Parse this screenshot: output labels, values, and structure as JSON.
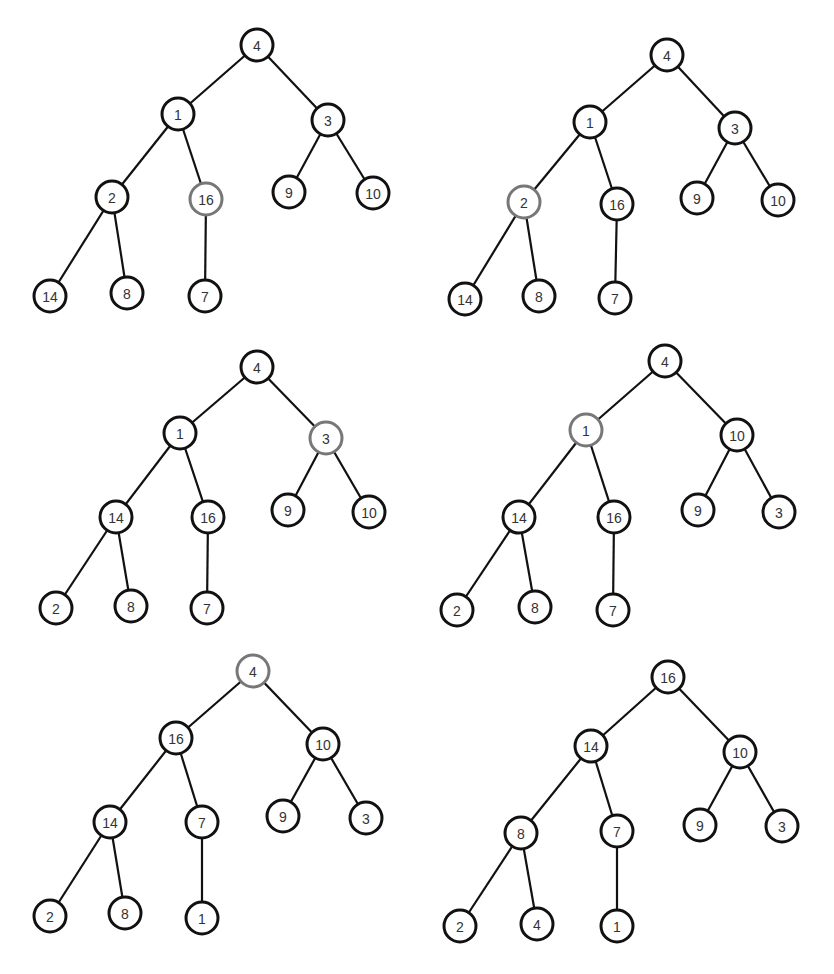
{
  "diagram": {
    "node_radius": 16,
    "colors": {
      "node_border": "#111111",
      "highlight_border": "#777777",
      "edge": "#111111",
      "text": "#333333",
      "background": "#ffffff"
    },
    "trees": [
      {
        "id": "step-a",
        "highlight": "16",
        "nodes": [
          {
            "id": "n0",
            "label": "4",
            "x": 257,
            "y": 45
          },
          {
            "id": "n1",
            "label": "1",
            "x": 178,
            "y": 114
          },
          {
            "id": "n2",
            "label": "3",
            "x": 328,
            "y": 120
          },
          {
            "id": "n3",
            "label": "2",
            "x": 112,
            "y": 197
          },
          {
            "id": "n4",
            "label": "16",
            "x": 206,
            "y": 199,
            "highlight": true
          },
          {
            "id": "n5",
            "label": "9",
            "x": 289,
            "y": 192
          },
          {
            "id": "n6",
            "label": "10",
            "x": 373,
            "y": 193
          },
          {
            "id": "n7",
            "label": "14",
            "x": 50,
            "y": 296
          },
          {
            "id": "n8",
            "label": "8",
            "x": 127,
            "y": 293
          },
          {
            "id": "n9",
            "label": "7",
            "x": 205,
            "y": 296
          }
        ],
        "edges": [
          [
            "n0",
            "n1"
          ],
          [
            "n0",
            "n2"
          ],
          [
            "n1",
            "n3"
          ],
          [
            "n1",
            "n4"
          ],
          [
            "n2",
            "n5"
          ],
          [
            "n2",
            "n6"
          ],
          [
            "n3",
            "n7"
          ],
          [
            "n3",
            "n8"
          ],
          [
            "n4",
            "n9"
          ]
        ]
      },
      {
        "id": "step-b",
        "highlight": "2",
        "nodes": [
          {
            "id": "n0",
            "label": "4",
            "x": 667,
            "y": 55
          },
          {
            "id": "n1",
            "label": "1",
            "x": 590,
            "y": 122
          },
          {
            "id": "n2",
            "label": "3",
            "x": 735,
            "y": 128
          },
          {
            "id": "n3",
            "label": "2",
            "x": 524,
            "y": 202,
            "highlight": true
          },
          {
            "id": "n4",
            "label": "16",
            "x": 617,
            "y": 204
          },
          {
            "id": "n5",
            "label": "9",
            "x": 697,
            "y": 198
          },
          {
            "id": "n6",
            "label": "10",
            "x": 778,
            "y": 200
          },
          {
            "id": "n7",
            "label": "14",
            "x": 465,
            "y": 299
          },
          {
            "id": "n8",
            "label": "8",
            "x": 539,
            "y": 296
          },
          {
            "id": "n9",
            "label": "7",
            "x": 615,
            "y": 298
          }
        ],
        "edges": [
          [
            "n0",
            "n1"
          ],
          [
            "n0",
            "n2"
          ],
          [
            "n1",
            "n3"
          ],
          [
            "n1",
            "n4"
          ],
          [
            "n2",
            "n5"
          ],
          [
            "n2",
            "n6"
          ],
          [
            "n3",
            "n7"
          ],
          [
            "n3",
            "n8"
          ],
          [
            "n4",
            "n9"
          ]
        ]
      },
      {
        "id": "step-c",
        "highlight": "3",
        "nodes": [
          {
            "id": "n0",
            "label": "4",
            "x": 257,
            "y": 367
          },
          {
            "id": "n1",
            "label": "1",
            "x": 180,
            "y": 433
          },
          {
            "id": "n2",
            "label": "3",
            "x": 326,
            "y": 438,
            "highlight": true
          },
          {
            "id": "n3",
            "label": "14",
            "x": 116,
            "y": 517
          },
          {
            "id": "n4",
            "label": "16",
            "x": 208,
            "y": 517
          },
          {
            "id": "n5",
            "label": "9",
            "x": 288,
            "y": 510
          },
          {
            "id": "n6",
            "label": "10",
            "x": 369,
            "y": 512
          },
          {
            "id": "n7",
            "label": "2",
            "x": 56,
            "y": 608
          },
          {
            "id": "n8",
            "label": "8",
            "x": 131,
            "y": 606
          },
          {
            "id": "n9",
            "label": "7",
            "x": 207,
            "y": 608
          }
        ],
        "edges": [
          [
            "n0",
            "n1"
          ],
          [
            "n0",
            "n2"
          ],
          [
            "n1",
            "n3"
          ],
          [
            "n1",
            "n4"
          ],
          [
            "n2",
            "n5"
          ],
          [
            "n2",
            "n6"
          ],
          [
            "n3",
            "n7"
          ],
          [
            "n3",
            "n8"
          ],
          [
            "n4",
            "n9"
          ]
        ]
      },
      {
        "id": "step-d",
        "highlight": "1",
        "nodes": [
          {
            "id": "n0",
            "label": "4",
            "x": 665,
            "y": 361
          },
          {
            "id": "n1",
            "label": "1",
            "x": 586,
            "y": 430,
            "highlight": true
          },
          {
            "id": "n2",
            "label": "10",
            "x": 737,
            "y": 435
          },
          {
            "id": "n3",
            "label": "14",
            "x": 519,
            "y": 517
          },
          {
            "id": "n4",
            "label": "16",
            "x": 614,
            "y": 517
          },
          {
            "id": "n5",
            "label": "9",
            "x": 698,
            "y": 510
          },
          {
            "id": "n6",
            "label": "3",
            "x": 779,
            "y": 512
          },
          {
            "id": "n7",
            "label": "2",
            "x": 457,
            "y": 610
          },
          {
            "id": "n8",
            "label": "8",
            "x": 535,
            "y": 607
          },
          {
            "id": "n9",
            "label": "7",
            "x": 613,
            "y": 610
          }
        ],
        "edges": [
          [
            "n0",
            "n1"
          ],
          [
            "n0",
            "n2"
          ],
          [
            "n1",
            "n3"
          ],
          [
            "n1",
            "n4"
          ],
          [
            "n2",
            "n5"
          ],
          [
            "n2",
            "n6"
          ],
          [
            "n3",
            "n7"
          ],
          [
            "n3",
            "n8"
          ],
          [
            "n4",
            "n9"
          ]
        ]
      },
      {
        "id": "step-e",
        "highlight": "4",
        "nodes": [
          {
            "id": "n0",
            "label": "4",
            "x": 253,
            "y": 671,
            "highlight": true
          },
          {
            "id": "n1",
            "label": "16",
            "x": 176,
            "y": 738
          },
          {
            "id": "n2",
            "label": "10",
            "x": 323,
            "y": 744
          },
          {
            "id": "n3",
            "label": "14",
            "x": 110,
            "y": 822
          },
          {
            "id": "n4",
            "label": "7",
            "x": 202,
            "y": 822
          },
          {
            "id": "n5",
            "label": "9",
            "x": 283,
            "y": 816
          },
          {
            "id": "n6",
            "label": "3",
            "x": 366,
            "y": 818
          },
          {
            "id": "n7",
            "label": "2",
            "x": 50,
            "y": 916
          },
          {
            "id": "n8",
            "label": "8",
            "x": 125,
            "y": 913
          },
          {
            "id": "n9",
            "label": "1",
            "x": 202,
            "y": 918
          }
        ],
        "edges": [
          [
            "n0",
            "n1"
          ],
          [
            "n0",
            "n2"
          ],
          [
            "n1",
            "n3"
          ],
          [
            "n1",
            "n4"
          ],
          [
            "n2",
            "n5"
          ],
          [
            "n2",
            "n6"
          ],
          [
            "n3",
            "n7"
          ],
          [
            "n3",
            "n8"
          ],
          [
            "n4",
            "n9"
          ]
        ]
      },
      {
        "id": "step-f",
        "highlight": null,
        "nodes": [
          {
            "id": "n0",
            "label": "16",
            "x": 668,
            "y": 677
          },
          {
            "id": "n1",
            "label": "14",
            "x": 591,
            "y": 746
          },
          {
            "id": "n2",
            "label": "10",
            "x": 740,
            "y": 752
          },
          {
            "id": "n3",
            "label": "8",
            "x": 521,
            "y": 833
          },
          {
            "id": "n4",
            "label": "7",
            "x": 617,
            "y": 831
          },
          {
            "id": "n5",
            "label": "9",
            "x": 700,
            "y": 825
          },
          {
            "id": "n6",
            "label": "3",
            "x": 782,
            "y": 826
          },
          {
            "id": "n7",
            "label": "2",
            "x": 460,
            "y": 926
          },
          {
            "id": "n8",
            "label": "4",
            "x": 537,
            "y": 924
          },
          {
            "id": "n9",
            "label": "1",
            "x": 617,
            "y": 926
          }
        ],
        "edges": [
          [
            "n0",
            "n1"
          ],
          [
            "n0",
            "n2"
          ],
          [
            "n1",
            "n3"
          ],
          [
            "n1",
            "n4"
          ],
          [
            "n2",
            "n5"
          ],
          [
            "n2",
            "n6"
          ],
          [
            "n3",
            "n7"
          ],
          [
            "n3",
            "n8"
          ],
          [
            "n4",
            "n9"
          ]
        ]
      }
    ]
  }
}
